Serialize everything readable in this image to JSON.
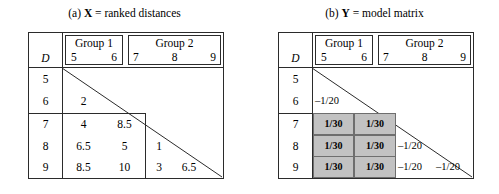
{
  "panels": [
    {
      "id": "a",
      "caption_prefix": "(a) ",
      "caption_symbol": "X",
      "caption_rest": " = ranked distances",
      "row_header_label": "D",
      "groups": [
        {
          "title": "Group 1",
          "items": [
            "5",
            "6"
          ]
        },
        {
          "title": "Group 2",
          "items": [
            "7",
            "8",
            "9"
          ]
        }
      ],
      "row_labels": [
        "5",
        "6",
        "7",
        "8",
        "9"
      ],
      "values": {
        "r6c5": "2",
        "r7c5": "4",
        "r7c6": "8.5",
        "r8c5": "6.5",
        "r8c6": "5",
        "r8c7": "1",
        "r9c5": "8.5",
        "r9c6": "10",
        "r9c7": "3",
        "r9c8": "6.5"
      }
    },
    {
      "id": "b",
      "caption_prefix": "(b) ",
      "caption_symbol": "Y",
      "caption_rest": " = model matrix",
      "row_header_label": "D",
      "groups": [
        {
          "title": "Group 1",
          "items": [
            "5",
            "6"
          ]
        },
        {
          "title": "Group 2",
          "items": [
            "7",
            "8",
            "9"
          ]
        }
      ],
      "row_labels": [
        "5",
        "6",
        "7",
        "8",
        "9"
      ],
      "values": {
        "r6c5": "–1/20",
        "r7c5": "1/30",
        "r7c6": "1/30",
        "r8c5": "1/30",
        "r8c6": "1/30",
        "r8c7": "–1/20",
        "r9c5": "1/30",
        "r9c6": "1/30",
        "r9c7": "–1/20",
        "r9c8": "–1/20"
      }
    }
  ],
  "style": {
    "shade_color": "#c2c2c2",
    "line_color": "#2b2b2b",
    "background": "#ffffff"
  }
}
